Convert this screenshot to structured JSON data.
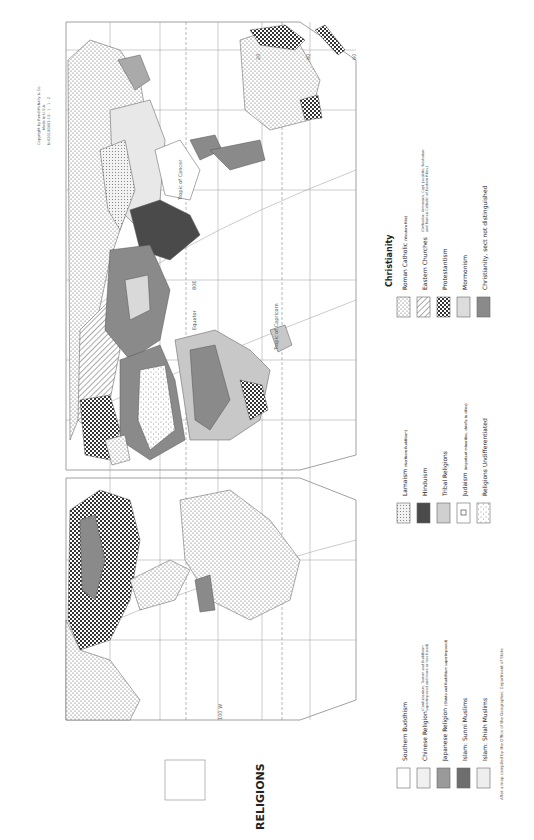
{
  "title": "RELIGIONS",
  "copyright": {
    "line1": "Copyright by Rand McNally & Co.",
    "line2": "Made in U.S.A.",
    "line3": "N-020180003-1S - 1 - 1 - 2"
  },
  "legend": {
    "christianity_heading": "Christianity",
    "christianity": [
      {
        "label": "Roman Catholic",
        "note": "(Western Rite)",
        "pattern": "dots"
      },
      {
        "label": "Eastern Churches",
        "note": "(Orthodox, Armenian, Copt, Jacobite, Nestorian and Roman Catholic of Eastern Rites.)",
        "pattern": "hatch"
      },
      {
        "label": "Protestantism",
        "note": "",
        "pattern": "checker"
      },
      {
        "label": "Mormonism",
        "note": "",
        "pattern": "light-gray"
      },
      {
        "label": "Christianity, sect not distinguished",
        "note": "",
        "pattern": "mid-gray"
      }
    ],
    "middle": [
      {
        "label": "Lamaism",
        "note": "(Northern Buddhism)",
        "pattern": "fine-dots"
      },
      {
        "label": "Hinduism",
        "note": "",
        "pattern": "dark-gray"
      },
      {
        "label": "Tribal Religions",
        "note": "",
        "pattern": "pale-gray"
      },
      {
        "label": "Judaism",
        "note": "(important minorities, chiefly in cities)",
        "pattern": "star"
      },
      {
        "label": "Religions Undifferentiated",
        "note": "",
        "pattern": "sparse-dots"
      }
    ],
    "left": [
      {
        "label": "Southern Buddhism",
        "note": "",
        "pattern": "white"
      },
      {
        "label": "Chinese Religion",
        "note": "(Confucianism, Taoism and Buddhism superimposed and more or less fused)",
        "pattern": "very-light"
      },
      {
        "label": "Japanese Religion",
        "note": "(Shinto and Buddhism superimposed)",
        "pattern": "gray"
      },
      {
        "label": "Islam: Sunni Muslims",
        "note": "",
        "pattern": "mid-dark"
      },
      {
        "label": "Islam: Shiah Muslims",
        "note": "",
        "pattern": "very-light-2"
      }
    ],
    "source": "After a map compiled by the Office of the Geographer, Department of State"
  },
  "map_labels": {
    "equator": "Equator",
    "tropic_cancer": "Tropic of Cancer",
    "tropic_capricorn": "Tropic of Capricorn",
    "lon_80e": "80E",
    "lon_100w": "100 W",
    "lat": [
      "0",
      "20",
      "40",
      "60"
    ],
    "lon": [
      "0",
      "20",
      "40",
      "60",
      "80",
      "100",
      "120",
      "140",
      "160"
    ]
  },
  "colors": {
    "ink": "#222222",
    "grid": "#888888",
    "light_gray": "#d9d9d9",
    "mid_gray": "#8a8a8a",
    "dark_gray": "#4a4a4a",
    "pale_gray": "#c8c8c8"
  }
}
